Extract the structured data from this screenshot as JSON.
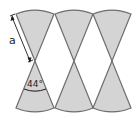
{
  "diagram": {
    "labels": {
      "side_length": "a",
      "angle": "44°"
    },
    "colors": {
      "sector_fill": "#d4d4d4",
      "sector_stroke": "#6e6e6e",
      "annotation": "#1a1a1a",
      "background": "#ffffff"
    },
    "columns": [
      {
        "center_x": 35,
        "apex_y": 61
      },
      {
        "center_x": 74,
        "apex_y": 61
      },
      {
        "center_x": 112,
        "apex_y": 61
      }
    ],
    "sector_angle_deg": 44
  }
}
